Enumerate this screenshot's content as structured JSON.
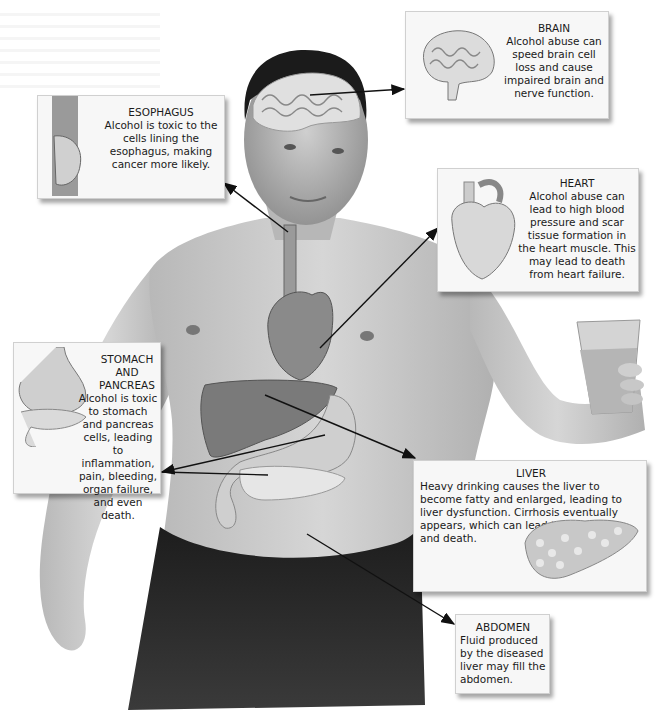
{
  "diagram": {
    "colors": {
      "skin": "#c9c9c9",
      "hair": "#1b1b1b",
      "shorts": "#2a2a2a",
      "organ": "#8a8a8a",
      "box_bg": "#f7f7f7",
      "arrow": "#111111"
    },
    "callouts": {
      "brain": {
        "title": "BRAIN",
        "text": "Alcohol abuse can speed brain cell loss and cause impaired brain and nerve function.",
        "icon": "brain-illustration"
      },
      "esophagus": {
        "title": "ESOPHAGUS",
        "text": "Alcohol is toxic to the cells lining the esophagus, making cancer more likely.",
        "icon": "esophagus-illustration"
      },
      "heart": {
        "title": "HEART",
        "text": "Alcohol abuse can lead to high blood pressure and scar tissue formation in the heart muscle. This may lead to death from heart failure.",
        "icon": "heart-illustration"
      },
      "stomach_pancreas": {
        "title": "STOMACH AND PANCREAS",
        "text": "Alcohol is toxic to stomach and pancreas cells, leading to inflammation, pain, bleeding, organ failure, and even death.",
        "icon": "stomach-pancreas-illustration"
      },
      "liver": {
        "title": "LIVER",
        "text": "Heavy drinking causes the liver to become fatty and enlarged, leading to liver dysfunction. Cirrhosis eventually appears, which can lead to liver failure and death.",
        "icon": "cirrhotic-liver-illustration"
      },
      "abdomen": {
        "title": "ABDOMEN",
        "text": "Fluid produced by the diseased liver may fill the abdomen.",
        "icon": null
      }
    }
  }
}
